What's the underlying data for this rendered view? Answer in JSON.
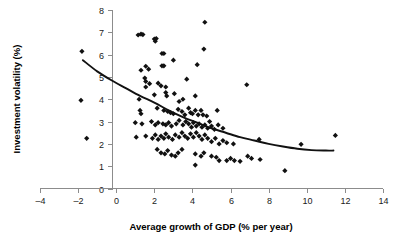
{
  "chart_data": {
    "type": "scatter",
    "title": "",
    "xlabel": "Average growth of GDP (% per year)",
    "ylabel": "Investment volatility (%)",
    "xlim": [
      -4,
      14
    ],
    "ylim": [
      0,
      8
    ],
    "xticks": [
      -4,
      -2,
      0,
      2,
      4,
      6,
      8,
      10,
      12,
      14
    ],
    "yticks": [
      0,
      1,
      2,
      3,
      4,
      5,
      6,
      7,
      8
    ],
    "xtick_labels": [
      "-4",
      "-2",
      "0",
      "2",
      "4",
      "6",
      "8",
      "10",
      "12",
      "14"
    ],
    "ytick_labels": [
      "0",
      "1",
      "2",
      "3",
      "4",
      "5",
      "6",
      "7",
      "8"
    ],
    "grid": false,
    "legend": null,
    "marker": "diamond",
    "marker_color": "#111111",
    "series": [
      {
        "name": "Countries",
        "points": [
          [
            -1.8,
            6.15
          ],
          [
            -1.85,
            3.95
          ],
          [
            -1.55,
            2.25
          ],
          [
            1.15,
            6.88
          ],
          [
            1.3,
            6.92
          ],
          [
            1.4,
            6.9
          ],
          [
            2.0,
            6.7
          ],
          [
            2.1,
            6.72
          ],
          [
            2.05,
            6.6
          ],
          [
            2.4,
            6.05
          ],
          [
            2.5,
            6.05
          ],
          [
            4.65,
            7.45
          ],
          [
            4.6,
            6.25
          ],
          [
            1.3,
            5.3
          ],
          [
            1.55,
            5.48
          ],
          [
            1.7,
            5.35
          ],
          [
            2.4,
            5.5
          ],
          [
            2.5,
            5.5
          ],
          [
            3.0,
            5.75
          ],
          [
            4.25,
            5.55
          ],
          [
            1.5,
            4.95
          ],
          [
            1.55,
            4.8
          ],
          [
            1.75,
            4.7
          ],
          [
            1.55,
            4.55
          ],
          [
            2.2,
            4.72
          ],
          [
            2.35,
            4.6
          ],
          [
            2.6,
            4.55
          ],
          [
            3.7,
            4.9
          ],
          [
            6.85,
            4.65
          ],
          [
            1.2,
            4.0
          ],
          [
            2.0,
            4.2
          ],
          [
            2.6,
            4.3
          ],
          [
            2.65,
            4.15
          ],
          [
            3.05,
            4.25
          ],
          [
            3.5,
            4.0
          ],
          [
            4.15,
            4.15
          ],
          [
            3.3,
            3.9
          ],
          [
            1.25,
            3.5
          ],
          [
            1.3,
            3.35
          ],
          [
            2.15,
            3.6
          ],
          [
            2.5,
            3.5
          ],
          [
            2.7,
            3.45
          ],
          [
            2.85,
            3.4
          ],
          [
            3.0,
            3.35
          ],
          [
            3.25,
            3.55
          ],
          [
            3.45,
            3.45
          ],
          [
            3.6,
            3.3
          ],
          [
            3.8,
            3.6
          ],
          [
            3.9,
            3.4
          ],
          [
            4.0,
            3.35
          ],
          [
            4.15,
            3.5
          ],
          [
            4.3,
            3.3
          ],
          [
            4.45,
            3.5
          ],
          [
            4.55,
            3.3
          ],
          [
            4.75,
            3.25
          ],
          [
            5.3,
            3.5
          ],
          [
            4.9,
            3.0
          ],
          [
            1.0,
            2.95
          ],
          [
            1.35,
            2.9
          ],
          [
            1.85,
            3.0
          ],
          [
            2.05,
            2.85
          ],
          [
            2.2,
            2.95
          ],
          [
            2.45,
            2.9
          ],
          [
            2.6,
            2.85
          ],
          [
            2.75,
            2.95
          ],
          [
            2.9,
            2.8
          ],
          [
            3.15,
            2.9
          ],
          [
            3.3,
            3.05
          ],
          [
            3.5,
            2.85
          ],
          [
            3.65,
            3.0
          ],
          [
            3.8,
            2.9
          ],
          [
            3.95,
            2.75
          ],
          [
            4.05,
            2.95
          ],
          [
            4.2,
            2.8
          ],
          [
            4.35,
            2.9
          ],
          [
            4.5,
            2.75
          ],
          [
            4.65,
            2.85
          ],
          [
            4.8,
            2.7
          ],
          [
            5.0,
            2.8
          ],
          [
            5.15,
            2.65
          ],
          [
            5.35,
            2.85
          ],
          [
            5.6,
            2.7
          ],
          [
            1.05,
            2.3
          ],
          [
            1.55,
            2.35
          ],
          [
            1.9,
            2.25
          ],
          [
            2.05,
            2.4
          ],
          [
            2.2,
            2.2
          ],
          [
            2.35,
            2.35
          ],
          [
            2.5,
            2.25
          ],
          [
            2.6,
            2.45
          ],
          [
            2.75,
            2.3
          ],
          [
            2.95,
            2.2
          ],
          [
            3.1,
            2.4
          ],
          [
            3.3,
            2.3
          ],
          [
            3.45,
            2.5
          ],
          [
            3.6,
            2.35
          ],
          [
            3.75,
            2.25
          ],
          [
            3.9,
            2.45
          ],
          [
            4.05,
            2.3
          ],
          [
            4.2,
            2.5
          ],
          [
            4.35,
            2.35
          ],
          [
            4.5,
            2.2
          ],
          [
            4.65,
            2.4
          ],
          [
            4.8,
            2.25
          ],
          [
            5.0,
            2.1
          ],
          [
            5.2,
            2.25
          ],
          [
            5.4,
            2.0
          ],
          [
            5.6,
            2.15
          ],
          [
            5.8,
            2.05
          ],
          [
            6.15,
            2.0
          ],
          [
            7.5,
            2.2
          ],
          [
            9.7,
            1.98
          ],
          [
            11.5,
            2.38
          ],
          [
            2.15,
            1.75
          ],
          [
            2.35,
            1.6
          ],
          [
            2.55,
            1.55
          ],
          [
            2.7,
            1.7
          ],
          [
            2.9,
            1.5
          ],
          [
            3.1,
            1.45
          ],
          [
            3.25,
            1.6
          ],
          [
            3.45,
            1.75
          ],
          [
            4.15,
            1.55
          ],
          [
            4.45,
            1.45
          ],
          [
            4.6,
            1.6
          ],
          [
            5.0,
            1.45
          ],
          [
            5.25,
            1.4
          ],
          [
            6.0,
            1.35
          ],
          [
            6.2,
            1.25
          ],
          [
            6.9,
            1.45
          ],
          [
            7.1,
            1.35
          ],
          [
            7.55,
            1.3
          ],
          [
            5.4,
            1.25
          ],
          [
            5.8,
            1.25
          ],
          [
            6.5,
            1.22
          ],
          [
            4.15,
            1.05
          ],
          [
            8.85,
            0.8
          ]
        ]
      }
    ],
    "trend_line": {
      "name": "fitted curve",
      "color": "#111111",
      "points": [
        [
          -1.75,
          5.75
        ],
        [
          -1.0,
          5.25
        ],
        [
          -0.25,
          4.85
        ],
        [
          0.5,
          4.5
        ],
        [
          1.25,
          4.15
        ],
        [
          2.0,
          3.85
        ],
        [
          2.75,
          3.5
        ],
        [
          3.5,
          3.2
        ],
        [
          4.25,
          2.95
        ],
        [
          5.0,
          2.7
        ],
        [
          5.75,
          2.5
        ],
        [
          6.5,
          2.3
        ],
        [
          7.25,
          2.15
        ],
        [
          8.0,
          2.0
        ],
        [
          8.75,
          1.88
        ],
        [
          9.5,
          1.78
        ],
        [
          10.25,
          1.72
        ],
        [
          11.0,
          1.7
        ],
        [
          11.4,
          1.7
        ]
      ]
    }
  }
}
